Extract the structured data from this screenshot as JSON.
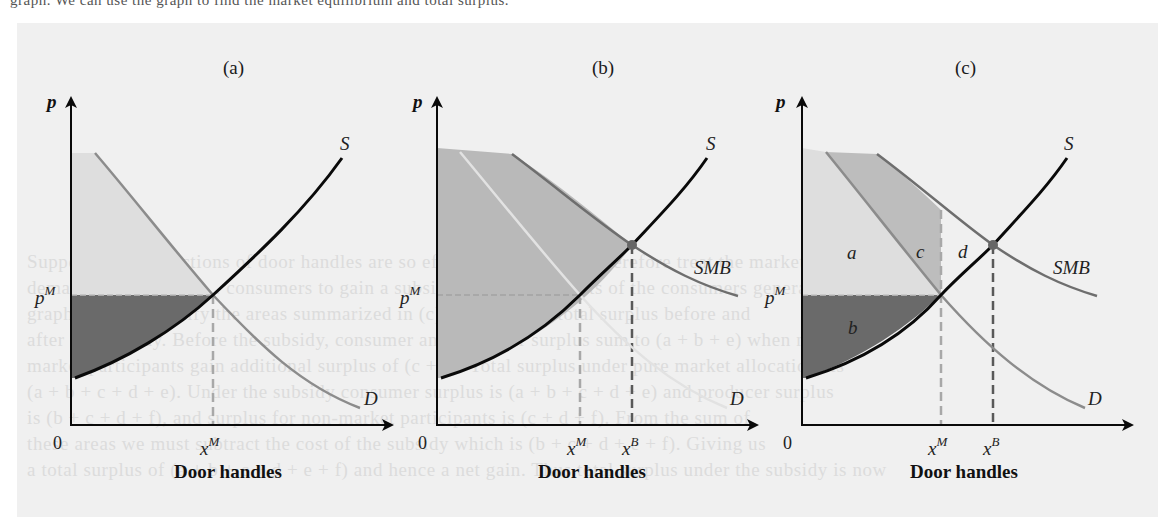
{
  "page": {
    "top_fragment": "graph. We can use the graph to find the market equilibrium and total surplus.",
    "bleed_through_lines": [
      "Suppose that Inspections of door handles are so effective that we can therefore treat the market",
      "demand curve as D, . . . consumers to gain a subsidy, with the benefits of the consumers generated by the",
      "graph, we can identify the areas summarized in (c) that make up total surplus before and",
      "after the subsidy. Before the subsidy, consumer and producer surplus sum to (a + b + e) when non-",
      "market participants gain additional surplus of (c + d). Total surplus under pure market allocations is",
      "(a + b + c + d + e). Under the subsidy consumer surplus is (a + b + c + d + e) and producer surplus",
      "is (b + c + d + f), and surplus for non-market participants is (c + d + f). From the sum of",
      "these areas we must subtract the cost of the subsidy which is (b + c + d + e + f). Giving us",
      "a total surplus of (a + b + c + d + e + f) and hence a net gain. Thus total surplus under the subsidy is now"
    ]
  },
  "colors": {
    "figure_background": "#f0f0f0",
    "supply_curve": "#0a0a0a",
    "demand_curve_a": "#8c8c8c",
    "demand_curve_b": "#dcdcdc",
    "demand_curve_c": "#8c8c8c",
    "smb_curve": "#6e6e6e",
    "consumer_surplus_fill": "#dedede",
    "producer_surplus_fill": "#6a6a6a",
    "total_surplus_fill_b": "#b9b9b9",
    "area_c_fill": "#bdbdbd",
    "dashed_xm": "#a8a8a8",
    "dashed_xb": "#595959",
    "equilibrium_dot": "#666666"
  },
  "panels": [
    {
      "id": "a",
      "label": "(a)",
      "y_axis_label": "p",
      "x_axis_title": "Door handles",
      "origin_label": "0",
      "price_label": "p",
      "price_sup": "M",
      "quantity_labels": [
        {
          "base": "x",
          "sup": "M"
        }
      ],
      "curve_labels": {
        "supply": "S",
        "demand": "D"
      }
    },
    {
      "id": "b",
      "label": "(b)",
      "y_axis_label": "p",
      "x_axis_title": "Door handles",
      "origin_label": "0",
      "price_label": "p",
      "price_sup": "M",
      "quantity_labels": [
        {
          "base": "x",
          "sup": "M"
        },
        {
          "base": "x",
          "sup": "B"
        }
      ],
      "curve_labels": {
        "supply": "S",
        "demand": "D",
        "smb": "SMB"
      }
    },
    {
      "id": "c",
      "label": "(c)",
      "y_axis_label": "p",
      "x_axis_title": "Door handles",
      "origin_label": "0",
      "price_label": "p",
      "price_sup": "M",
      "quantity_labels": [
        {
          "base": "x",
          "sup": "M"
        },
        {
          "base": "x",
          "sup": "B"
        }
      ],
      "curve_labels": {
        "supply": "S",
        "demand": "D",
        "smb": "SMB"
      },
      "area_labels": {
        "a": "a",
        "b": "b",
        "c": "c",
        "d": "d"
      }
    }
  ]
}
